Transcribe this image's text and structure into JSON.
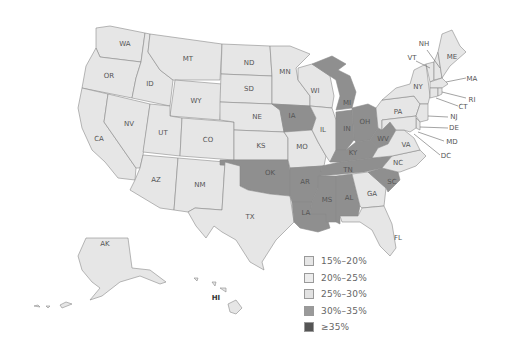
{
  "map": {
    "type": "choropleth",
    "region": "United States",
    "colors": {
      "15-20": "#e6e6e6",
      "20-25": "#e9e9e9",
      "25-30": "#e3e3e3",
      "30-35": "#8f8f8f",
      "35plus": "#555555"
    },
    "labels": {
      "WA": "WA",
      "OR": "OR",
      "CA": "CA",
      "ID": "ID",
      "NV": "NV",
      "MT": "MT",
      "WY": "WY",
      "UT": "UT",
      "AZ": "AZ",
      "CO": "CO",
      "NM": "NM",
      "ND": "ND",
      "SD": "SD",
      "NE": "NE",
      "KS": "KS",
      "OK": "OK",
      "TX": "TX",
      "MN": "MN",
      "IA": "IA",
      "MO": "MO",
      "AR": "AR",
      "LA": "LA",
      "WI": "WI",
      "IL": "IL",
      "MI": "MI",
      "IN": "IN",
      "OH": "OH",
      "KY": "KY",
      "TN": "TN",
      "MS": "MS",
      "AL": "AL",
      "GA": "GA",
      "FL": "FL",
      "SC": "SC",
      "NC": "NC",
      "VA": "VA",
      "WV": "WV",
      "PA": "PA",
      "NY": "NY",
      "VT": "VT",
      "NH": "NH",
      "ME": "ME",
      "MA": "MA",
      "RI": "RI",
      "CT": "CT",
      "NJ": "NJ",
      "DE": "DE",
      "MD": "MD",
      "DC": "DC",
      "AK": "AK",
      "HI": "HI"
    },
    "high_states_30_35": [
      "IA",
      "MI",
      "IN",
      "OH",
      "KY",
      "WV",
      "TN",
      "OK",
      "AR",
      "LA",
      "MS",
      "AL",
      "SC"
    ]
  },
  "legend": {
    "items": [
      {
        "label": "15%–20%",
        "color": "#e6e6e6"
      },
      {
        "label": "20%–25%",
        "color": "#ececec"
      },
      {
        "label": "25%–30%",
        "color": "#e2e2e2"
      },
      {
        "label": "30%–35%",
        "color": "#9a9a9a"
      },
      {
        "label": "≥35%",
        "color": "#555555"
      }
    ]
  }
}
